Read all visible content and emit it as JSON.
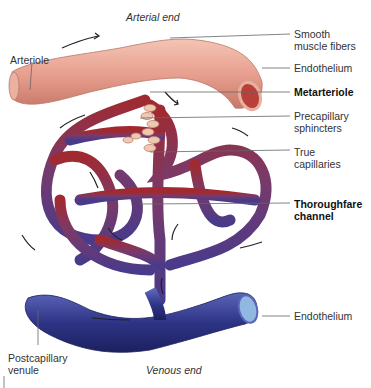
{
  "labels": {
    "arterial_end": "Arterial end",
    "venous_end": "Venous end",
    "arteriole": "Arteriole",
    "smooth_muscle_1": "Smooth",
    "smooth_muscle_2": "muscle fibers",
    "endothelium_top": "Endothelium",
    "metarteriole": "Metarteriole",
    "precap_1": "Precapillary",
    "precap_2": "sphincters",
    "true_cap_1": "True",
    "true_cap_2": "capillaries",
    "thoroughfare_1": "Thoroughfare",
    "thoroughfare_2": "channel",
    "endothelium_bottom": "Endothelium",
    "postcap_1": "Postcapillary",
    "postcap_2": "venule"
  },
  "colors": {
    "arteriole": "#e8a898",
    "capillary_red": "#a83a4a",
    "capillary_purple": "#6a3a78",
    "venule": "#3a3e90",
    "leader": "#555555"
  }
}
